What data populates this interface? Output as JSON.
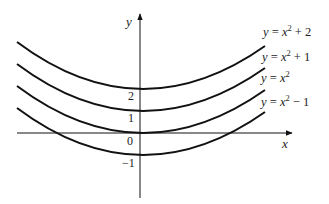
{
  "diagram": {
    "type": "family-of-parabolas",
    "axes": {
      "x_label": "x",
      "y_label": "y",
      "y_ticks": [
        "2",
        "1",
        "0",
        "−1"
      ]
    },
    "curves": [
      {
        "id": "c1",
        "name": "y = x² + 2",
        "lhs": "y",
        "eq": " = ",
        "base": "x",
        "exp": "2",
        "tail": " + 2",
        "shift": 2
      },
      {
        "id": "c2",
        "name": "y = x² + 1",
        "lhs": "y",
        "eq": " = ",
        "base": "x",
        "exp": "2",
        "tail": " + 1",
        "shift": 1
      },
      {
        "id": "c3",
        "name": "y = x²",
        "lhs": "y",
        "eq": " = ",
        "base": "x",
        "exp": "2",
        "tail": "",
        "shift": 0
      },
      {
        "id": "c4",
        "name": "y = x² − 1",
        "lhs": "y",
        "eq": " = ",
        "base": "x",
        "exp": "2",
        "tail": " − 1",
        "shift": -1
      }
    ],
    "colors": {
      "stroke": "#111111",
      "text": "#222222",
      "background": "#ffffff"
    }
  }
}
